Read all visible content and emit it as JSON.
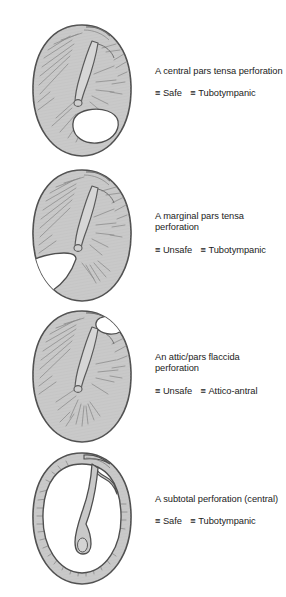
{
  "figure": {
    "colors": {
      "drum_fill": "#c9c9c9",
      "drum_outline": "#555555",
      "perforation_fill": "#ffffff",
      "hatch_line": "#8d8d8d",
      "text": "#1b1b1b",
      "background": "#ffffff"
    },
    "tag_symbol": "≡"
  },
  "panels": [
    {
      "id": "central-pars-tensa",
      "title": "A central pars tensa perforation",
      "title_lines": [
        "A central pars tensa",
        "perforation"
      ],
      "tags": [
        {
          "symbol": "≡",
          "label": "Safe"
        },
        {
          "symbol": "≡",
          "label": "Tubotympanic"
        }
      ],
      "diagram": {
        "name": "eardrum-central-perforation",
        "perforation": "large oval hole in lower-posterior pars tensa, rim of drum intact"
      }
    },
    {
      "id": "marginal-pars-tensa",
      "title": "A marginal pars tensa perforation",
      "title_lines": [
        "A marginal pars tensa",
        "perforation"
      ],
      "tags": [
        {
          "symbol": "≡",
          "label": "Unsafe"
        },
        {
          "symbol": "≡",
          "label": "Tubotympanic"
        }
      ],
      "diagram": {
        "name": "eardrum-marginal-perforation",
        "perforation": "hole in lower-anterior quadrant reaching the annulus margin"
      }
    },
    {
      "id": "attic-pars-flaccida",
      "title": "An attic/pars flaccida perforation",
      "title_lines": [
        "An attic/pars flaccida",
        "perforation"
      ],
      "tags": [
        {
          "symbol": "≡",
          "label": "Unsafe"
        },
        {
          "symbol": "≡",
          "label": "Attico-antral"
        }
      ],
      "diagram": {
        "name": "eardrum-attic-perforation",
        "perforation": "small oval hole at superior-posterior attic / pars flaccida"
      }
    },
    {
      "id": "subtotal-central",
      "title": "A subtotal perforation (central)",
      "title_lines": [
        "A subtotal perforation",
        "(central)"
      ],
      "tags": [
        {
          "symbol": "≡",
          "label": "Safe"
        },
        {
          "symbol": "≡",
          "label": "Tubotympanic"
        }
      ],
      "diagram": {
        "name": "eardrum-subtotal-perforation",
        "perforation": "nearly the whole pars tensa absent, only narrow rim and malleus handle remain"
      }
    }
  ]
}
